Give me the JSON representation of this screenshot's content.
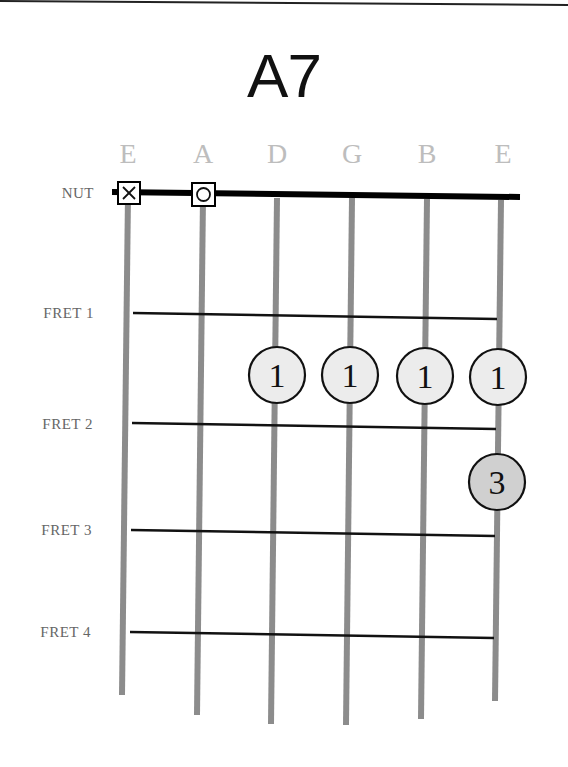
{
  "chord": {
    "name": "A7"
  },
  "strings": [
    {
      "label": "E",
      "x_top": 128,
      "x_bottom": 122,
      "y_bottom": 695,
      "state": "muted"
    },
    {
      "label": "A",
      "x_top": 203,
      "x_bottom": 197,
      "y_bottom": 715,
      "state": "open"
    },
    {
      "label": "D",
      "x_top": 277,
      "x_bottom": 271,
      "y_bottom": 724,
      "state": "fretted"
    },
    {
      "label": "G",
      "x_top": 352,
      "x_bottom": 346,
      "y_bottom": 725,
      "state": "fretted"
    },
    {
      "label": "B",
      "x_top": 427,
      "x_bottom": 421,
      "y_bottom": 719,
      "state": "fretted"
    },
    {
      "label": "E",
      "x_top": 501,
      "x_bottom": 495,
      "y_bottom": 701,
      "state": "fretted"
    }
  ],
  "rows": {
    "nut": {
      "label": "NUT",
      "y": 192
    },
    "frets": [
      {
        "label": "FRET 1",
        "y": 315
      },
      {
        "label": "FRET 2",
        "y": 425
      },
      {
        "label": "FRET 3",
        "y": 533
      },
      {
        "label": "FRET 4",
        "y": 634
      }
    ]
  },
  "markers": {
    "muted_symbol": "X",
    "open_symbol": "O"
  },
  "fingers": [
    {
      "string": 3,
      "finger": "1",
      "cx": 277,
      "cy": 375,
      "fill": "#ececec"
    },
    {
      "string": 4,
      "finger": "1",
      "cx": 350,
      "cy": 375,
      "fill": "#ececec"
    },
    {
      "string": 5,
      "finger": "1",
      "cx": 425,
      "cy": 376,
      "fill": "#ececec"
    },
    {
      "string": 6,
      "finger": "1",
      "cx": 498,
      "cy": 377,
      "fill": "#ececec"
    },
    {
      "string": 6,
      "finger": "3",
      "cx": 497,
      "cy": 482,
      "fill": "#d0d0d0"
    }
  ],
  "colors": {
    "string": "#8c8c8c",
    "fret": "#111111",
    "nut": "#000000",
    "label": "#666666",
    "string_name": "#bdbdbd"
  }
}
